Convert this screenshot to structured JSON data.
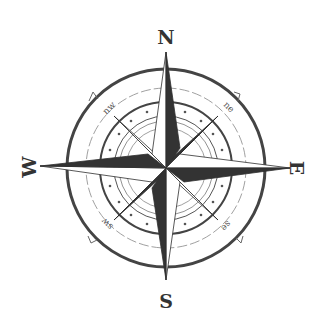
{
  "figure": {
    "type": "compass-rose",
    "colors": {
      "ink": "#2e2e2e",
      "light_fill": "#ffffff",
      "dark_fill": "#3a3a3a",
      "ring": "#444444",
      "thin_ring": "#777777"
    },
    "cardinal_labels": {
      "north": "N",
      "east": "E",
      "south": "S",
      "west": "W"
    },
    "intercardinal_labels": {
      "northeast": "ne",
      "southeast": "se",
      "southwest": "sw",
      "northwest": "nw"
    }
  }
}
